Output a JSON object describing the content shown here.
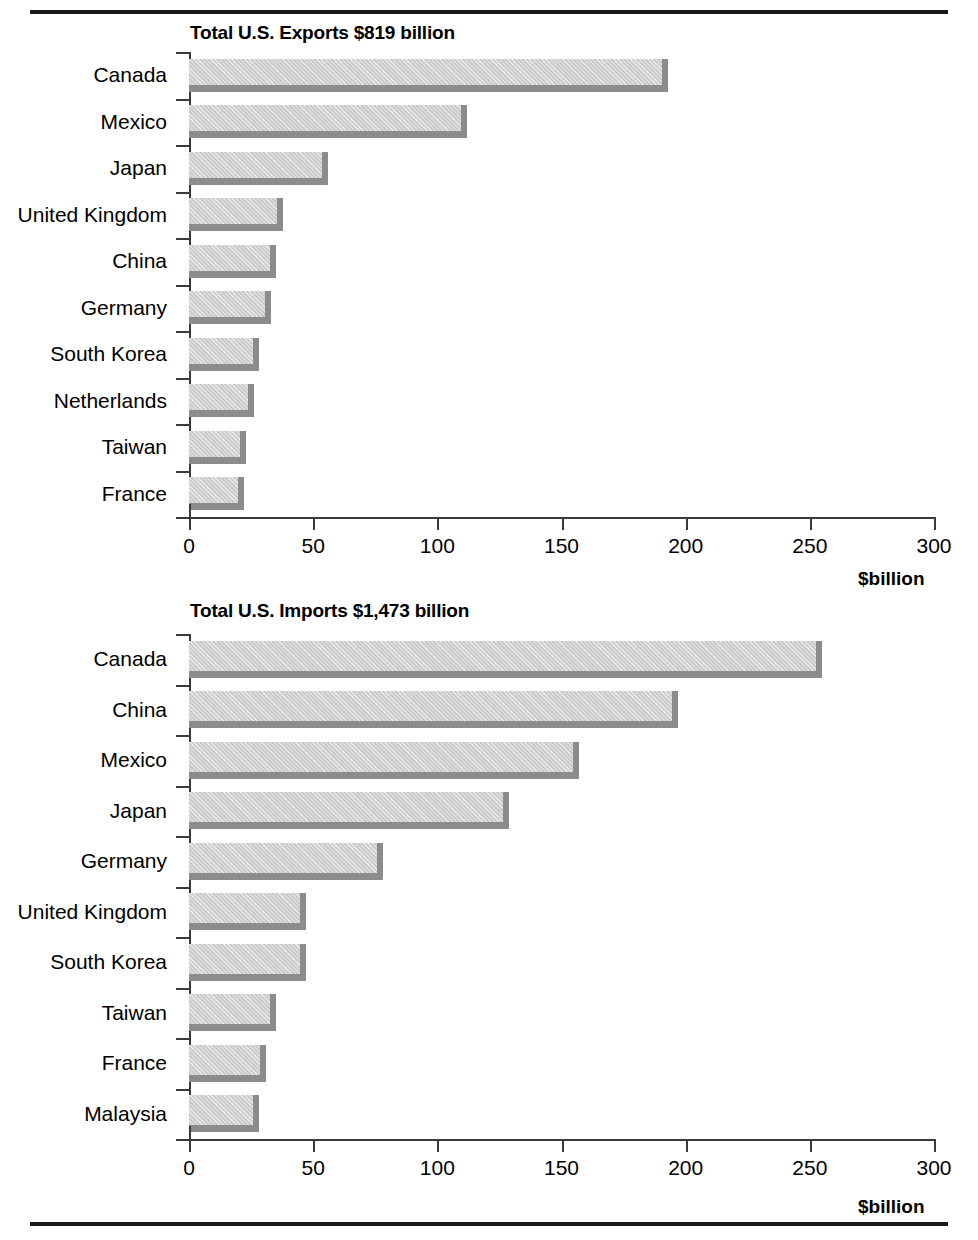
{
  "chart_data": [
    {
      "type": "bar",
      "orientation": "horizontal",
      "title": "Total U.S. Exports $819 billion",
      "xlabel": "$billion",
      "ylabel": "",
      "xlim": [
        0,
        300
      ],
      "xticks": [
        0,
        50,
        100,
        150,
        200,
        250,
        300
      ],
      "xtick_labels": [
        "0",
        "50",
        "100",
        "150",
        "200",
        "250",
        "300"
      ],
      "grid": false,
      "legend": false,
      "categories": [
        "Canada",
        "Mexico",
        "Japan",
        "United Kingdom",
        "China",
        "Germany",
        "South Korea",
        "Netherlands",
        "Taiwan",
        "France"
      ],
      "values": [
        193,
        112,
        56,
        38,
        35,
        33,
        28,
        26,
        23,
        22
      ]
    },
    {
      "type": "bar",
      "orientation": "horizontal",
      "title": "Total U.S. Imports $1,473 billion",
      "xlabel": "$billion",
      "ylabel": "",
      "xlim": [
        0,
        300
      ],
      "xticks": [
        0,
        50,
        100,
        150,
        200,
        250,
        300
      ],
      "xtick_labels": [
        "0",
        "50",
        "100",
        "150",
        "200",
        "250",
        "300"
      ],
      "grid": false,
      "legend": false,
      "categories": [
        "Canada",
        "China",
        "Mexico",
        "Japan",
        "Germany",
        "United Kingdom",
        "South Korea",
        "Taiwan",
        "France",
        "Malaysia"
      ],
      "values": [
        255,
        197,
        157,
        129,
        78,
        47,
        47,
        35,
        31,
        28
      ]
    }
  ],
  "colors": {
    "bar_face": "#cccccc",
    "bar_shadow": "#8c8c8c",
    "axis": "#3a3a3a",
    "text": "#000000",
    "rule": "#1a1a1a"
  }
}
